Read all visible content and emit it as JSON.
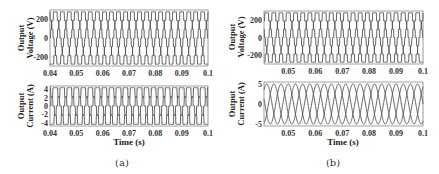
{
  "chart_data": [
    {
      "panel": "(a)",
      "type": "line",
      "subplots": [
        {
          "ylabel": "Output Voltage (V)",
          "yticks": [
            -200,
            0,
            200
          ],
          "ylim": [
            -300,
            300
          ],
          "xlim": [
            0.04,
            0.1
          ],
          "xticks": [
            "0.04",
            "0.05",
            "0.06",
            "0.07",
            "0.08",
            "0.09",
            "0.1"
          ],
          "grid": true,
          "waveform": "multilevel-staircase",
          "amplitude": 280,
          "levels": 7,
          "frequency_hz": 125,
          "series": [
            {
              "name": "Phase A",
              "phase_deg": 0
            },
            {
              "name": "Phase B",
              "phase_deg": -120
            },
            {
              "name": "Phase C",
              "phase_deg": 120
            }
          ]
        },
        {
          "ylabel": "Output Current (A)",
          "xlabel": "Time (s)",
          "yticks": [
            -4,
            -2,
            0,
            2,
            4
          ],
          "ylim": [
            -4.8,
            4.8
          ],
          "xlim": [
            0.04,
            0.1
          ],
          "xticks": [
            "0.04",
            "0.05",
            "0.06",
            "0.07",
            "0.08",
            "0.09",
            "0.1"
          ],
          "grid": true,
          "waveform": "multilevel-staircase",
          "amplitude": 4.4,
          "levels": 5,
          "frequency_hz": 125,
          "series": [
            {
              "name": "Phase A",
              "phase_deg": 0
            },
            {
              "name": "Phase B",
              "phase_deg": -120
            },
            {
              "name": "Phase C",
              "phase_deg": 120
            }
          ]
        }
      ]
    },
    {
      "panel": "(b)",
      "type": "line",
      "subplots": [
        {
          "ylabel": "Output Voltage (V)",
          "yticks": [
            -200,
            0,
            200
          ],
          "ylim": [
            -300,
            300
          ],
          "xlim": [
            0.041,
            0.1
          ],
          "xticks": [
            "0.05",
            "0.06",
            "0.07",
            "0.08",
            "0.09",
            "0.1"
          ],
          "grid": true,
          "waveform": "multilevel-staircase",
          "amplitude": 280,
          "levels": 7,
          "frequency_hz": 125,
          "series": [
            {
              "name": "Phase A",
              "phase_deg": 0
            },
            {
              "name": "Phase B",
              "phase_deg": -120
            },
            {
              "name": "Phase C",
              "phase_deg": 120
            }
          ]
        },
        {
          "ylabel": "Output Current (A)",
          "xlabel": "Time (s)",
          "yticks": [
            -5,
            0,
            5
          ],
          "ylim": [
            -5.5,
            5.5
          ],
          "xlim": [
            0.041,
            0.1
          ],
          "xticks": [
            "0.05",
            "0.06",
            "0.07",
            "0.08",
            "0.09",
            "0.1"
          ],
          "grid": true,
          "waveform": "sine",
          "amplitude": 5,
          "frequency_hz": 125,
          "series": [
            {
              "name": "Phase A",
              "phase_deg": 0
            },
            {
              "name": "Phase B",
              "phase_deg": -120
            },
            {
              "name": "Phase C",
              "phase_deg": 120
            }
          ]
        }
      ]
    }
  ],
  "labels": {
    "a_v_ylabel_1": "Output",
    "a_v_ylabel_2": "Voltage (V)",
    "a_i_ylabel_1": "Output",
    "a_i_ylabel_2": "Current (A)",
    "b_v_ylabel_1": "Output",
    "b_v_ylabel_2": "Voltage (V)",
    "b_i_ylabel_1": "Output",
    "b_i_ylabel_2": "Current (A)",
    "a_xlabel": "Time (s)",
    "b_xlabel": "Time (s)",
    "caption_a": "(a)",
    "caption_b": "(b)"
  },
  "colors": {
    "trace": "#555555",
    "grid": "#c8c8c8",
    "axis": "#666666"
  }
}
